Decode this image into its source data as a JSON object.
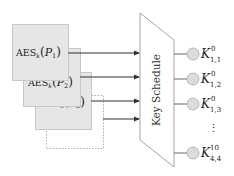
{
  "diagram": {
    "colors": {
      "box_fill": "#e6e6e6",
      "box_stroke": "#c8c8c8",
      "dotted_stroke": "#999999",
      "arrow": "#333333",
      "trap_stroke": "#9a9a9a",
      "node_fill": "#dcdcdc",
      "node_stroke": "#aaaaaa",
      "line": "#555555"
    },
    "boxes": [
      {
        "id": "aes-p1",
        "prefix": "AES",
        "sub": "k",
        "arg": "P",
        "arg_sub": "1"
      },
      {
        "id": "aes-p2",
        "prefix": "AES",
        "sub": "k",
        "arg": "P",
        "arg_sub": "2"
      },
      {
        "id": "aes-p3",
        "prefix": "AES",
        "sub": "k",
        "arg": "P",
        "arg_sub": "3"
      }
    ],
    "block": {
      "label": "Key Schedule"
    },
    "outputs": [
      {
        "base": "K",
        "sup": "0",
        "sub": "1,1"
      },
      {
        "base": "K",
        "sup": "0",
        "sub": "1,2"
      },
      {
        "base": "K",
        "sup": "0",
        "sub": "1,3"
      },
      {
        "base": "K",
        "sup": "10",
        "sub": "4,4"
      }
    ],
    "ellipsis": "⋮"
  }
}
